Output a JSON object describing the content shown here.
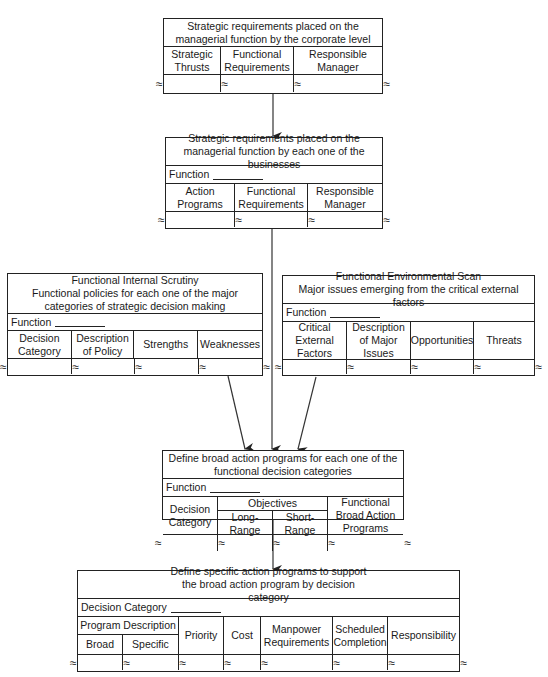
{
  "box1": {
    "title": "Strategic requirements placed on the managerial function by the corporate level",
    "columns": [
      "Strategic Thrusts",
      "Functional Requirements",
      "Responsible Manager"
    ]
  },
  "box2": {
    "title": "Strategic requirements placed on the managerial function by each one of the businesses",
    "function_label": "Function",
    "columns": [
      "Action Programs",
      "Functional Requirements",
      "Responsible Manager"
    ]
  },
  "box3": {
    "title_line1": "Functional Internal Scrutiny",
    "title_line2": "Functional policies for each one of the major categories of strategic decision making",
    "function_label": "Function",
    "columns": [
      "Decision Category",
      "Description of Policy",
      "Strengths",
      "Weaknesses"
    ]
  },
  "box4": {
    "title_line1": "Functional Environmental Scan",
    "title_line2": "Major issues emerging from the critical external factors",
    "function_label": "Function",
    "columns": [
      "Critical External Factors",
      "Description of Major Issues",
      "Opportunities",
      "Threats"
    ]
  },
  "box5": {
    "title": "Define broad action programs for each one of the functional decision categories",
    "function_label": "Function",
    "columns": {
      "decision_category": "Decision Category",
      "objectives": "Objectives",
      "objectives_sub": [
        "Long-Range",
        "Short-Range"
      ],
      "broad_programs": "Functional Broad Action Programs"
    }
  },
  "box6": {
    "title": "Define specific action programs to support the broad action program by decision category",
    "category_label": "Decision Category",
    "columns": {
      "program_description": "Program Description",
      "program_description_sub": [
        "Broad",
        "Specific"
      ],
      "priority": "Priority",
      "cost": "Cost",
      "manpower": "Manpower Requirements",
      "scheduled": "Scheduled Completion",
      "responsibility": "Responsibility"
    }
  },
  "break_symbol": "≈"
}
